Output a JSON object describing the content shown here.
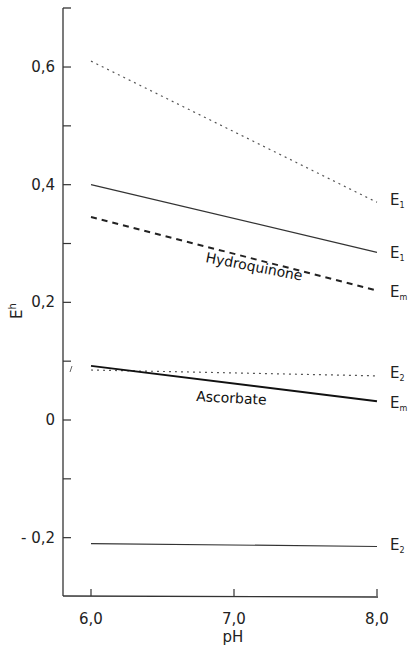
{
  "chart_data": {
    "type": "line",
    "title": "",
    "xlabel": "pH",
    "ylabel": "E_h",
    "xlim": [
      5.8,
      8.0
    ],
    "ylim": [
      -0.3,
      0.7
    ],
    "x_ticks": [
      "6.0",
      "7.0",
      "8.0"
    ],
    "y_ticks": [
      "0.6",
      "0.4",
      "0.2",
      "0",
      "-0.2"
    ],
    "y_tick_labels_display": [
      "0,6",
      "0,4",
      "0,2",
      "0",
      "- 0,2"
    ],
    "x_tick_labels_display": [
      "6,0",
      "7,0",
      "8,0"
    ],
    "grid": false,
    "legend": "none (labels at line ends)",
    "annotations": [
      "Hydroquinone",
      "Ascorbate"
    ],
    "series": [
      {
        "name": "E1 (upper, dotted)",
        "label": "E",
        "sub": "1",
        "style": "dotted",
        "x": [
          6.0,
          8.0
        ],
        "values": [
          0.61,
          0.37
        ]
      },
      {
        "name": "E1 (Hydroquinone, solid)",
        "label": "E",
        "sub": "1",
        "style": "solid",
        "x": [
          6.0,
          8.0
        ],
        "values": [
          0.4,
          0.285
        ]
      },
      {
        "name": "Em (Hydroquinone, dashed)",
        "label": "E",
        "sub": "m",
        "style": "dashed",
        "x": [
          6.0,
          8.0
        ],
        "values": [
          0.345,
          0.22
        ]
      },
      {
        "name": "E2 (Ascorbate, dotted)",
        "label": "E",
        "sub": "2",
        "style": "dotted",
        "x": [
          6.0,
          8.0
        ],
        "values": [
          0.085,
          0.075
        ]
      },
      {
        "name": "Em (Ascorbate, solid bold)",
        "label": "E",
        "sub": "m",
        "style": "solid-bold",
        "x": [
          6.0,
          8.0
        ],
        "values": [
          0.092,
          0.032
        ]
      },
      {
        "name": "E2 (lower, solid)",
        "label": "E",
        "sub": "2",
        "style": "solid",
        "x": [
          6.0,
          8.0
        ],
        "values": [
          -0.21,
          -0.215
        ]
      }
    ]
  },
  "labels": {
    "xlabel": "pH",
    "ylabel_main": "E",
    "ylabel_sub": "h",
    "hydroquinone": "Hydroquinone",
    "ascorbate": "Ascorbate"
  }
}
